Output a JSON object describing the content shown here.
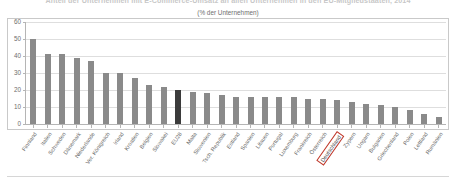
{
  "chart_data": {
    "type": "bar",
    "title": "Anteil der Unternehmen mit E-Commerce-Umsatz an allen Unternehmen in den EU-Mitgliedstaaten, 2014",
    "subtitle": "(% der Unternehmen)",
    "xlabel": "",
    "ylabel": "",
    "ylim": [
      0,
      60
    ],
    "yticks": [
      0,
      10,
      20,
      30,
      40,
      50,
      60
    ],
    "grid": true,
    "legend": null,
    "highlight_category": "EU28",
    "boxed_category": "Deutschland",
    "categories": [
      "Finnland",
      "Italien",
      "Schweden",
      "Dänemark",
      "Niederlande",
      "Ver. Königreich",
      "Irland",
      "Kroatien",
      "Belgien",
      "Slowakei",
      "EU28",
      "Malta",
      "Slowenien",
      "Tsch. Republik",
      "Estland",
      "Spanien",
      "Litauen",
      "Portugal",
      "Luxemburg",
      "Frankreich",
      "Österreich",
      "Deutschland",
      "Zypern",
      "Ungarn",
      "Bulgarien",
      "Griechenland",
      "Polen",
      "Lettland",
      "Rumänien"
    ],
    "values": [
      50,
      41,
      41,
      39,
      37,
      30,
      30,
      27,
      23,
      22,
      20,
      19,
      18,
      17,
      16,
      16,
      16,
      16,
      16,
      15,
      15,
      14,
      13,
      12,
      11,
      10,
      8,
      6,
      4
    ]
  },
  "axis": {
    "y_tick_labels": [
      "0",
      "10",
      "20",
      "30",
      "40",
      "50",
      "60"
    ]
  },
  "colors": {
    "bar": "#8a8a8a",
    "bar_highlight": "#3b3b3b",
    "highlight_box_border": "#c0392b",
    "grid": "#dedede",
    "axis": "#b5b5b5",
    "frame": "#c9c9c9",
    "text": "#6b6b6b"
  }
}
